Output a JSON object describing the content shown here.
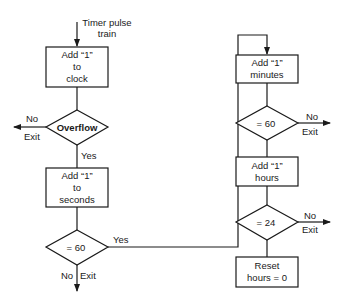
{
  "diagram": {
    "type": "flowchart",
    "title": "",
    "entry_label": [
      "Timer pulse",
      "train"
    ],
    "nodes": [
      {
        "id": "add-clock",
        "shape": "process",
        "lines": [
          "Add “1”",
          "to",
          "clock"
        ]
      },
      {
        "id": "overflow",
        "shape": "decision",
        "text": "Overflow",
        "no_label": "No",
        "exit_label": "Exit",
        "yes_label": "Yes"
      },
      {
        "id": "add-seconds",
        "shape": "process",
        "lines": [
          "Add “1”",
          "to",
          "seconds"
        ]
      },
      {
        "id": "seconds-60",
        "shape": "decision",
        "text": "= 60",
        "yes_label": "Yes",
        "no_label": "No",
        "exit_label": "Exit"
      },
      {
        "id": "add-minutes",
        "shape": "process",
        "lines": [
          "Add “1”",
          "minutes"
        ]
      },
      {
        "id": "minutes-60",
        "shape": "decision",
        "text": "= 60",
        "no_label": "No",
        "exit_label": "Exit"
      },
      {
        "id": "add-hours",
        "shape": "process",
        "lines": [
          "Add “1”",
          "hours"
        ]
      },
      {
        "id": "hours-24",
        "shape": "decision",
        "text": "= 24",
        "no_label": "No",
        "exit_label": "Exit"
      },
      {
        "id": "reset-hours",
        "shape": "process",
        "lines": [
          "Reset",
          "hours = 0"
        ]
      }
    ],
    "edges": [
      {
        "from": "entry",
        "to": "add-clock"
      },
      {
        "from": "add-clock",
        "to": "overflow"
      },
      {
        "from": "overflow",
        "to": "exit",
        "label": "No"
      },
      {
        "from": "overflow",
        "to": "add-seconds",
        "label": "Yes"
      },
      {
        "from": "add-seconds",
        "to": "seconds-60"
      },
      {
        "from": "seconds-60",
        "to": "add-minutes",
        "label": "Yes"
      },
      {
        "from": "seconds-60",
        "to": "exit",
        "label": "No"
      },
      {
        "from": "add-minutes",
        "to": "minutes-60"
      },
      {
        "from": "minutes-60",
        "to": "exit",
        "label": "No"
      },
      {
        "from": "minutes-60",
        "to": "add-hours"
      },
      {
        "from": "add-hours",
        "to": "hours-24"
      },
      {
        "from": "hours-24",
        "to": "exit",
        "label": "No"
      },
      {
        "from": "hours-24",
        "to": "reset-hours"
      }
    ],
    "colors": {
      "stroke": "#1a1a1a",
      "background": "#ffffff"
    }
  }
}
